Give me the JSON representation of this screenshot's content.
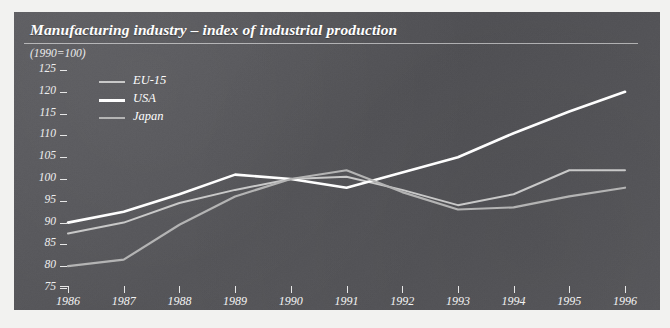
{
  "chart_data": {
    "type": "line",
    "title": "Manufacturing industry – index of industrial production",
    "subtitle": "(1990=100)",
    "xlabel": "",
    "ylabel": "",
    "x": [
      1986,
      1987,
      1988,
      1989,
      1990,
      1991,
      1992,
      1993,
      1994,
      1995,
      1996
    ],
    "categories": [
      "1986",
      "1987",
      "1988",
      "1989",
      "1990",
      "1991",
      "1992",
      "1993",
      "1994",
      "1995",
      "1996"
    ],
    "xlim": [
      1986,
      1996
    ],
    "ylim": [
      75,
      125
    ],
    "yticks": [
      75,
      80,
      85,
      90,
      95,
      100,
      105,
      110,
      115,
      120,
      125
    ],
    "ytick_labels": [
      "75",
      "80",
      "85",
      "90",
      "95",
      "100",
      "105",
      "110",
      "115",
      "120",
      "125"
    ],
    "grid": false,
    "legend_position": "upper-left",
    "series": [
      {
        "name": "EU-15",
        "color": "#c9c9c9",
        "values": [
          87.5,
          90.0,
          94.5,
          97.5,
          100.0,
          100.5,
          97.5,
          94.0,
          96.5,
          102.0,
          102.0
        ]
      },
      {
        "name": "USA",
        "color": "#ffffff",
        "values": [
          90.0,
          92.5,
          96.5,
          101.0,
          100.0,
          98.0,
          101.5,
          105.0,
          110.5,
          115.5,
          120.0
        ]
      },
      {
        "name": "Japan",
        "color": "#b4b4b4",
        "values": [
          80.0,
          81.5,
          89.5,
          96.0,
          100.0,
          102.0,
          97.0,
          93.0,
          93.5,
          96.0,
          98.0
        ]
      }
    ]
  },
  "figure": {
    "background_color": "#f2f2f0",
    "panel_color": "#56565a",
    "axis_color": "#e8e8e8",
    "text_color": "#ffffff"
  }
}
